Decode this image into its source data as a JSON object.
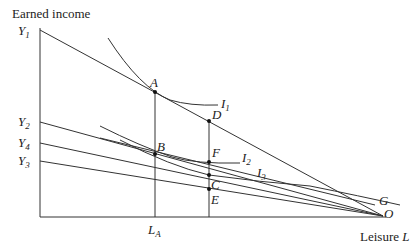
{
  "axes": {
    "y_label": "Earned income",
    "x_label": "Leisure",
    "x_symbol": "L"
  },
  "y_ticks": [
    {
      "base": "Y",
      "sub": "1"
    },
    {
      "base": "Y",
      "sub": "2"
    },
    {
      "base": "Y",
      "sub": "4"
    },
    {
      "base": "Y",
      "sub": "3"
    }
  ],
  "x_ticks": [
    {
      "base": "L",
      "sub": "A"
    }
  ],
  "points": [
    "A",
    "B",
    "C",
    "D",
    "E",
    "F",
    "G",
    "O"
  ],
  "curves": [
    {
      "base": "I",
      "sub": "1"
    },
    {
      "base": "I",
      "sub": "2"
    },
    {
      "base": "I",
      "sub": "3"
    }
  ]
}
